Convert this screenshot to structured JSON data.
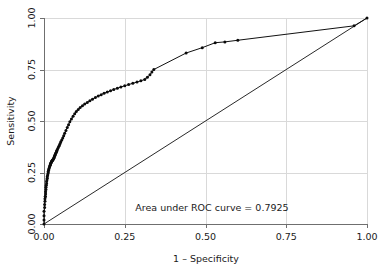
{
  "chart_data": {
    "type": "line",
    "title": "",
    "subtitle": "",
    "xlabel": "1 – Specificity",
    "ylabel": "Sensitivity",
    "xlim": [
      0,
      1
    ],
    "ylim": [
      0,
      1
    ],
    "grid": true,
    "legend_position": "none",
    "xticks": [
      "0.00",
      "0.25",
      "0.50",
      "0.75",
      "1.00"
    ],
    "xtick_values": [
      0,
      0.25,
      0.5,
      0.75,
      1
    ],
    "yticks": [
      "0.00",
      "0.25",
      "0.50",
      "0.75",
      "1.00"
    ],
    "ytick_values": [
      0,
      0.25,
      0.5,
      0.75,
      1
    ],
    "annotations": [
      {
        "name": "auc-annotation",
        "text": "Area under ROC curve = 0.7925",
        "x": 0.52,
        "y": 0.065
      }
    ],
    "series": [
      {
        "name": "ROC curve",
        "markers": true,
        "x": [
          0.0,
          0.0,
          0.0,
          0.0,
          0.002,
          0.002,
          0.003,
          0.003,
          0.004,
          0.004,
          0.005,
          0.005,
          0.006,
          0.006,
          0.007,
          0.008,
          0.008,
          0.009,
          0.01,
          0.01,
          0.011,
          0.012,
          0.013,
          0.013,
          0.014,
          0.015,
          0.016,
          0.017,
          0.018,
          0.019,
          0.02,
          0.02,
          0.021,
          0.022,
          0.023,
          0.024,
          0.024,
          0.025,
          0.026,
          0.027,
          0.028,
          0.029,
          0.03,
          0.031,
          0.032,
          0.033,
          0.034,
          0.035,
          0.036,
          0.038,
          0.039,
          0.04,
          0.042,
          0.044,
          0.046,
          0.048,
          0.05,
          0.052,
          0.055,
          0.058,
          0.061,
          0.064,
          0.068,
          0.072,
          0.076,
          0.08,
          0.085,
          0.09,
          0.095,
          0.1,
          0.106,
          0.112,
          0.119,
          0.126,
          0.134,
          0.142,
          0.15,
          0.159,
          0.168,
          0.177,
          0.186,
          0.196,
          0.206,
          0.216,
          0.227,
          0.238,
          0.25,
          0.262,
          0.275,
          0.288,
          0.3,
          0.312,
          0.32,
          0.328,
          0.334,
          0.34,
          0.44,
          0.49,
          0.53,
          0.56,
          0.6,
          0.96,
          1.0
        ],
        "y": [
          0.0,
          0.02,
          0.04,
          0.062,
          0.08,
          0.095,
          0.11,
          0.122,
          0.134,
          0.134,
          0.146,
          0.157,
          0.168,
          0.178,
          0.188,
          0.197,
          0.206,
          0.214,
          0.222,
          0.229,
          0.236,
          0.243,
          0.249,
          0.255,
          0.261,
          0.267,
          0.272,
          0.277,
          0.281,
          0.285,
          0.289,
          0.292,
          0.295,
          0.298,
          0.301,
          0.303,
          0.305,
          0.307,
          0.309,
          0.311,
          0.313,
          0.316,
          0.319,
          0.322,
          0.326,
          0.33,
          0.334,
          0.338,
          0.343,
          0.348,
          0.353,
          0.358,
          0.364,
          0.37,
          0.377,
          0.384,
          0.391,
          0.399,
          0.408,
          0.418,
          0.429,
          0.441,
          0.454,
          0.468,
          0.482,
          0.496,
          0.51,
          0.523,
          0.535,
          0.546,
          0.556,
          0.565,
          0.574,
          0.582,
          0.59,
          0.598,
          0.606,
          0.614,
          0.621,
          0.628,
          0.635,
          0.641,
          0.647,
          0.653,
          0.659,
          0.665,
          0.671,
          0.677,
          0.683,
          0.689,
          0.695,
          0.702,
          0.712,
          0.724,
          0.738,
          0.75,
          0.83,
          0.856,
          0.88,
          0.884,
          0.892,
          0.962,
          1.0
        ]
      },
      {
        "name": "Reference line",
        "markers": false,
        "x": [
          0,
          1
        ],
        "y": [
          0,
          1
        ]
      }
    ],
    "auc": 0.7925
  },
  "figure": {
    "background_color": "#ffffff",
    "grid_color": "#d9d9d9",
    "axis_color": "#6f6f6f",
    "curve_color": "#111111",
    "marker_color": "#0b0b0b"
  }
}
